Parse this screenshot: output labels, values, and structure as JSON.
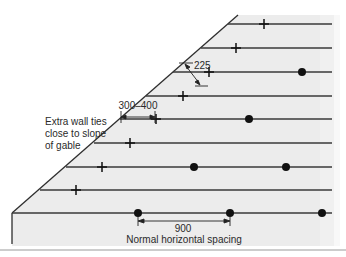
{
  "diagram": {
    "labels": {
      "extra_ties_line1": "Extra wall ties",
      "extra_ties_line2": "close to slope",
      "extra_ties_line3": "of gable",
      "dim_slope_offset": "300–400",
      "dim_vertical": "225",
      "dim_horizontal": "900",
      "horizontal_caption": "Normal horizontal spacing"
    },
    "colors": {
      "background_fill": "#ececec",
      "line": "#3a3a3a",
      "marker": "#111111"
    },
    "courses_y": [
      24,
      48,
      72,
      96,
      119,
      143,
      167,
      190,
      213
    ],
    "extra_ties_crosses": [
      {
        "x": 264,
        "y": 24
      },
      {
        "x": 236,
        "y": 48
      },
      {
        "x": 209,
        "y": 72
      },
      {
        "x": 183,
        "y": 96
      },
      {
        "x": 156,
        "y": 119
      },
      {
        "x": 130,
        "y": 143
      },
      {
        "x": 102,
        "y": 167
      },
      {
        "x": 76,
        "y": 190
      }
    ],
    "normal_ties_dots": [
      {
        "x": 302,
        "y": 72
      },
      {
        "x": 249,
        "y": 119
      },
      {
        "x": 194,
        "y": 167
      },
      {
        "x": 286,
        "y": 167
      },
      {
        "x": 138,
        "y": 213
      },
      {
        "x": 230,
        "y": 213
      },
      {
        "x": 322,
        "y": 213
      }
    ]
  }
}
